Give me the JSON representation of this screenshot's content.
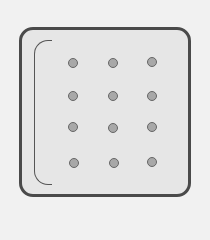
{
  "icon": {
    "name": "dot-grid-panel",
    "rows": 4,
    "cols": 3,
    "colors": {
      "background": "#f1f1f1",
      "panel_fill": "#e6e6e6",
      "panel_border": "#4a4a4a",
      "dot_fill": "#a8a8a8",
      "dot_ring": "#666666",
      "bracket": "#555555"
    },
    "dots": [
      {
        "x": 73,
        "y": 63
      },
      {
        "x": 113,
        "y": 63
      },
      {
        "x": 152,
        "y": 62
      },
      {
        "x": 73,
        "y": 96
      },
      {
        "x": 113,
        "y": 96
      },
      {
        "x": 152,
        "y": 96
      },
      {
        "x": 73,
        "y": 127
      },
      {
        "x": 113,
        "y": 128
      },
      {
        "x": 152,
        "y": 127
      },
      {
        "x": 74,
        "y": 163
      },
      {
        "x": 114,
        "y": 163
      },
      {
        "x": 152,
        "y": 162
      }
    ]
  }
}
